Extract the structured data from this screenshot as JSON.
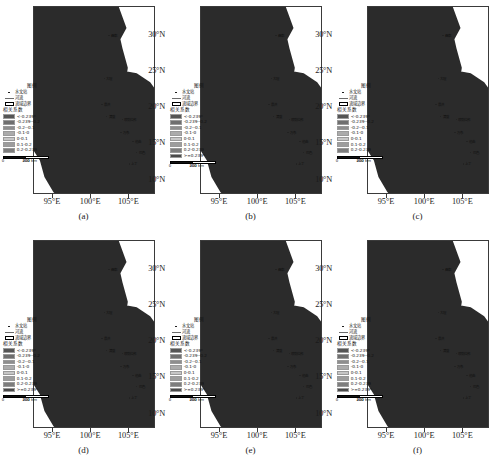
{
  "figure": {
    "type": "map-grid",
    "panel_count": 6,
    "region": "Lancang-Mekong River Basin",
    "colormap": "grayscale",
    "background": "#ffffff"
  },
  "axes": {
    "y_ticks": [
      "30°N",
      "25°N",
      "20°N",
      "15°N",
      "10°N"
    ],
    "y_values": [
      30,
      25,
      20,
      15,
      10
    ],
    "x_ticks": [
      "95°E",
      "100°E",
      "105°E"
    ],
    "x_values": [
      95,
      100,
      105
    ],
    "xlim": [
      92.5,
      108.5
    ],
    "ylim": [
      8.0,
      34.0
    ]
  },
  "legend": {
    "title": "图例",
    "station_label": "水文站",
    "river_label": "河流",
    "boundary_label": "流域边界",
    "scale_title": "相关系数",
    "classes_8": [
      "<-0.239*",
      "-0.239--0.2",
      "-0.2--0.1",
      "-0.1-0",
      "0-0.1",
      "0.1-0.2",
      "0.2-0.239",
      ">=0.239*"
    ],
    "classes_7": [
      "<-0.239*",
      "-0.239--0.2",
      "-0.2--0.1",
      "-0.1-0",
      "0-0.1",
      "0.1-0.2",
      "0.2-0.239"
    ],
    "colors_8": [
      "#555555",
      "#6f6f6f",
      "#8e8e8e",
      "#ababab",
      "#c6c6c6",
      "#9d9d9d",
      "#7d7d7d",
      "#4a4a4a"
    ],
    "colors_7": [
      "#555555",
      "#6f6f6f",
      "#8e8e8e",
      "#ababab",
      "#c6c6c6",
      "#9d9d9d",
      "#7d7d7d"
    ]
  },
  "scalebar": {
    "ticks": [
      "0",
      "200",
      "400"
    ],
    "unit": "km"
  },
  "cities": [
    {
      "name": "昌都",
      "x": 0.62,
      "y": 0.15
    },
    {
      "name": "大理",
      "x": 0.58,
      "y": 0.38
    },
    {
      "name": "景洪",
      "x": 0.56,
      "y": 0.52
    },
    {
      "name": "清盛",
      "x": 0.6,
      "y": 0.585
    },
    {
      "name": "琅勃拉邦",
      "x": 0.73,
      "y": 0.6
    },
    {
      "name": "万象",
      "x": 0.72,
      "y": 0.67
    },
    {
      "name": "他曲",
      "x": 0.82,
      "y": 0.72
    },
    {
      "name": "巴色",
      "x": 0.85,
      "y": 0.78
    },
    {
      "name": "上丁",
      "x": 0.79,
      "y": 0.84
    }
  ],
  "panels": [
    {
      "id": "a",
      "label": "(a)",
      "classes": 7
    },
    {
      "id": "b",
      "label": "(b)",
      "classes": 8
    },
    {
      "id": "c",
      "label": "(c)",
      "classes": 7
    },
    {
      "id": "d",
      "label": "(d)",
      "classes": 8
    },
    {
      "id": "e",
      "label": "(e)",
      "classes": 8
    },
    {
      "id": "f",
      "label": "(f)",
      "classes": 8
    }
  ]
}
